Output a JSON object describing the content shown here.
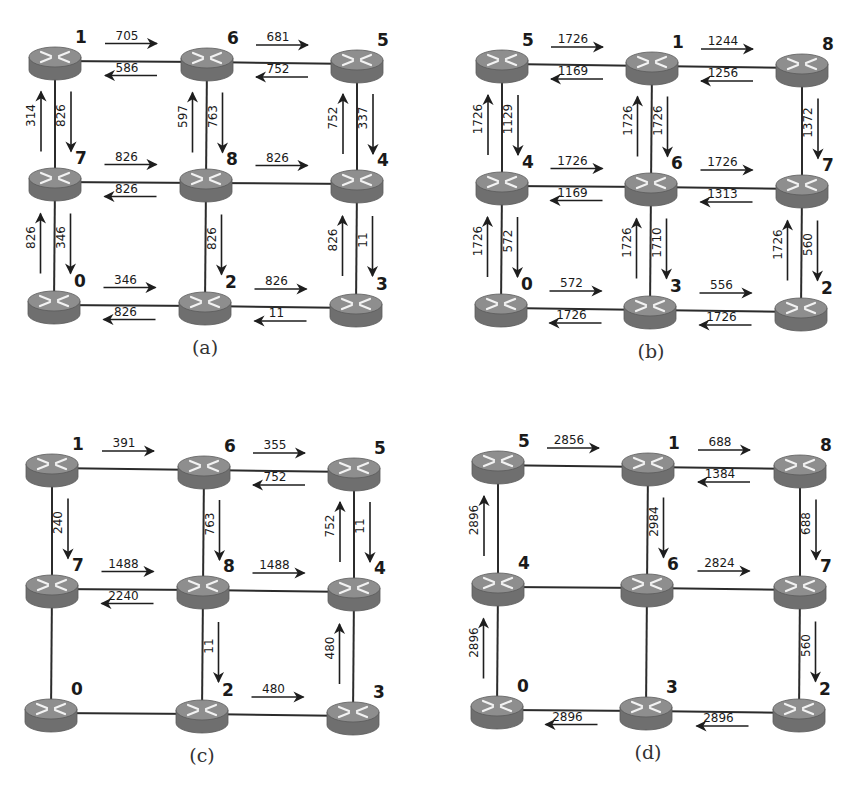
{
  "figure": {
    "panels": [
      {
        "id": "a",
        "caption": "(a)",
        "offset": [
          0,
          0
        ],
        "nodes": [
          {
            "label": "1",
            "x": 55,
            "y": 61
          },
          {
            "label": "6",
            "x": 207,
            "y": 62
          },
          {
            "label": "5",
            "x": 357,
            "y": 64
          },
          {
            "label": "7",
            "x": 55,
            "y": 182
          },
          {
            "label": "8",
            "x": 206,
            "y": 183
          },
          {
            "label": "4",
            "x": 357,
            "y": 184
          },
          {
            "label": "0",
            "x": 54,
            "y": 305
          },
          {
            "label": "2",
            "x": 205,
            "y": 306
          },
          {
            "label": "3",
            "x": 356,
            "y": 308
          }
        ],
        "links": [
          [
            0,
            1
          ],
          [
            1,
            2
          ],
          [
            3,
            4
          ],
          [
            4,
            5
          ],
          [
            6,
            7
          ],
          [
            7,
            8
          ],
          [
            0,
            3
          ],
          [
            3,
            6
          ],
          [
            1,
            4
          ],
          [
            4,
            7
          ],
          [
            2,
            5
          ],
          [
            5,
            8
          ]
        ],
        "flows": [
          {
            "from": 0,
            "to": 1,
            "value": "705"
          },
          {
            "from": 1,
            "to": 0,
            "value": "586"
          },
          {
            "from": 1,
            "to": 2,
            "value": "681"
          },
          {
            "from": 2,
            "to": 1,
            "value": "752"
          },
          {
            "from": 3,
            "to": 4,
            "value": "826"
          },
          {
            "from": 4,
            "to": 3,
            "value": "826"
          },
          {
            "from": 4,
            "to": 5,
            "value": "826"
          },
          {
            "from": 6,
            "to": 7,
            "value": "346"
          },
          {
            "from": 7,
            "to": 6,
            "value": "826"
          },
          {
            "from": 7,
            "to": 8,
            "value": "826"
          },
          {
            "from": 8,
            "to": 7,
            "value": "11"
          },
          {
            "from": 3,
            "to": 0,
            "value": "314"
          },
          {
            "from": 0,
            "to": 3,
            "value": "826"
          },
          {
            "from": 6,
            "to": 3,
            "value": "826"
          },
          {
            "from": 3,
            "to": 6,
            "value": "346"
          },
          {
            "from": 4,
            "to": 1,
            "value": "597"
          },
          {
            "from": 1,
            "to": 4,
            "value": "763"
          },
          {
            "from": 4,
            "to": 7,
            "value": "826"
          },
          {
            "from": 5,
            "to": 2,
            "value": "752"
          },
          {
            "from": 2,
            "to": 5,
            "value": "337"
          },
          {
            "from": 8,
            "to": 5,
            "value": "826"
          },
          {
            "from": 5,
            "to": 8,
            "value": "11"
          }
        ]
      },
      {
        "id": "b",
        "caption": "(b)",
        "offset": [
          0,
          0
        ],
        "nodes": [
          {
            "label": "5",
            "x": 502,
            "y": 64
          },
          {
            "label": "1",
            "x": 652,
            "y": 66
          },
          {
            "label": "8",
            "x": 802,
            "y": 68
          },
          {
            "label": "4",
            "x": 502,
            "y": 186
          },
          {
            "label": "6",
            "x": 651,
            "y": 187
          },
          {
            "label": "7",
            "x": 802,
            "y": 189
          },
          {
            "label": "0",
            "x": 501,
            "y": 308
          },
          {
            "label": "3",
            "x": 650,
            "y": 310
          },
          {
            "label": "2",
            "x": 801,
            "y": 312
          }
        ],
        "links": [
          [
            0,
            1
          ],
          [
            1,
            2
          ],
          [
            3,
            4
          ],
          [
            4,
            5
          ],
          [
            6,
            7
          ],
          [
            7,
            8
          ],
          [
            0,
            3
          ],
          [
            3,
            6
          ],
          [
            1,
            4
          ],
          [
            4,
            7
          ],
          [
            2,
            5
          ],
          [
            5,
            8
          ]
        ],
        "flows": [
          {
            "from": 0,
            "to": 1,
            "value": "1726"
          },
          {
            "from": 1,
            "to": 0,
            "value": "1169"
          },
          {
            "from": 1,
            "to": 2,
            "value": "1244"
          },
          {
            "from": 2,
            "to": 1,
            "value": "1256"
          },
          {
            "from": 3,
            "to": 4,
            "value": "1726"
          },
          {
            "from": 4,
            "to": 3,
            "value": "1169"
          },
          {
            "from": 4,
            "to": 5,
            "value": "1726"
          },
          {
            "from": 5,
            "to": 4,
            "value": "1313"
          },
          {
            "from": 6,
            "to": 7,
            "value": "572"
          },
          {
            "from": 7,
            "to": 6,
            "value": "1726"
          },
          {
            "from": 7,
            "to": 8,
            "value": "556"
          },
          {
            "from": 8,
            "to": 7,
            "value": "1726"
          },
          {
            "from": 3,
            "to": 0,
            "value": "1726"
          },
          {
            "from": 0,
            "to": 3,
            "value": "1129"
          },
          {
            "from": 6,
            "to": 3,
            "value": "1726"
          },
          {
            "from": 3,
            "to": 6,
            "value": "572"
          },
          {
            "from": 4,
            "to": 1,
            "value": "1726"
          },
          {
            "from": 1,
            "to": 4,
            "value": "1726"
          },
          {
            "from": 7,
            "to": 4,
            "value": "1726"
          },
          {
            "from": 4,
            "to": 7,
            "value": "1710"
          },
          {
            "from": 2,
            "to": 5,
            "value": "1372"
          },
          {
            "from": 8,
            "to": 5,
            "value": "1726"
          },
          {
            "from": 5,
            "to": 8,
            "value": "560"
          }
        ]
      },
      {
        "id": "c",
        "caption": "(c)",
        "offset": [
          0,
          0
        ],
        "nodes": [
          {
            "label": "1",
            "x": 52,
            "y": 468
          },
          {
            "label": "6",
            "x": 204,
            "y": 470
          },
          {
            "label": "5",
            "x": 354,
            "y": 472
          },
          {
            "label": "7",
            "x": 52,
            "y": 589
          },
          {
            "label": "8",
            "x": 203,
            "y": 590
          },
          {
            "label": "4",
            "x": 354,
            "y": 592
          },
          {
            "label": "0",
            "x": 51,
            "y": 713
          },
          {
            "label": "2",
            "x": 202,
            "y": 714
          },
          {
            "label": "3",
            "x": 353,
            "y": 716
          }
        ],
        "links": [
          [
            0,
            1
          ],
          [
            1,
            2
          ],
          [
            3,
            4
          ],
          [
            4,
            5
          ],
          [
            6,
            7
          ],
          [
            7,
            8
          ],
          [
            0,
            3
          ],
          [
            3,
            6
          ],
          [
            1,
            4
          ],
          [
            4,
            7
          ],
          [
            2,
            5
          ],
          [
            5,
            8
          ]
        ],
        "flows": [
          {
            "from": 0,
            "to": 1,
            "value": "391"
          },
          {
            "from": 1,
            "to": 2,
            "value": "355"
          },
          {
            "from": 2,
            "to": 1,
            "value": "752"
          },
          {
            "from": 3,
            "to": 4,
            "value": "1488"
          },
          {
            "from": 4,
            "to": 3,
            "value": "2240"
          },
          {
            "from": 4,
            "to": 5,
            "value": "1488"
          },
          {
            "from": 7,
            "to": 8,
            "value": "480"
          },
          {
            "from": 0,
            "to": 3,
            "value": "240"
          },
          {
            "from": 1,
            "to": 4,
            "value": "763"
          },
          {
            "from": 4,
            "to": 7,
            "value": "11"
          },
          {
            "from": 5,
            "to": 2,
            "value": "752"
          },
          {
            "from": 2,
            "to": 5,
            "value": "11"
          },
          {
            "from": 8,
            "to": 5,
            "value": "480"
          }
        ]
      },
      {
        "id": "d",
        "caption": "(d)",
        "offset": [
          0,
          0
        ],
        "nodes": [
          {
            "label": "5",
            "x": 498,
            "y": 465
          },
          {
            "label": "1",
            "x": 648,
            "y": 467
          },
          {
            "label": "8",
            "x": 800,
            "y": 469
          },
          {
            "label": "4",
            "x": 498,
            "y": 587
          },
          {
            "label": "6",
            "x": 647,
            "y": 588
          },
          {
            "label": "7",
            "x": 800,
            "y": 590
          },
          {
            "label": "0",
            "x": 497,
            "y": 710
          },
          {
            "label": "3",
            "x": 646,
            "y": 711
          },
          {
            "label": "2",
            "x": 799,
            "y": 713
          }
        ],
        "links": [
          [
            0,
            1
          ],
          [
            1,
            2
          ],
          [
            3,
            4
          ],
          [
            4,
            5
          ],
          [
            6,
            7
          ],
          [
            7,
            8
          ],
          [
            0,
            3
          ],
          [
            3,
            6
          ],
          [
            1,
            4
          ],
          [
            4,
            7
          ],
          [
            2,
            5
          ],
          [
            5,
            8
          ]
        ],
        "flows": [
          {
            "from": 0,
            "to": 1,
            "value": "2856"
          },
          {
            "from": 1,
            "to": 2,
            "value": "688"
          },
          {
            "from": 2,
            "to": 1,
            "value": "1384"
          },
          {
            "from": 4,
            "to": 5,
            "value": "2824"
          },
          {
            "from": 7,
            "to": 6,
            "value": "2896"
          },
          {
            "from": 8,
            "to": 7,
            "value": "2896"
          },
          {
            "from": 3,
            "to": 0,
            "value": "2896"
          },
          {
            "from": 6,
            "to": 3,
            "value": "2896"
          },
          {
            "from": 1,
            "to": 4,
            "value": "2984"
          },
          {
            "from": 2,
            "to": 5,
            "value": "688"
          },
          {
            "from": 5,
            "to": 8,
            "value": "560"
          }
        ]
      }
    ]
  },
  "style": {
    "link_color": "#2b2b2b",
    "arrow_color": "#1e1e1e",
    "router_top": "#8e8e8e",
    "router_side": "#6f6f6f",
    "router_edge": "#5a5a5a",
    "router_glyph": "#f2f2f2",
    "label_color": "#1a1a1a"
  }
}
